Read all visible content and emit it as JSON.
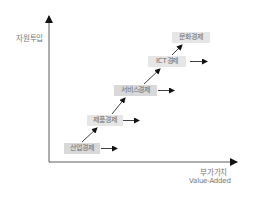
{
  "diagram": {
    "y_axis_label": "자원투입",
    "x_axis_label_ko": "부가가치",
    "x_axis_label_en": "Value-Added",
    "stages": [
      {
        "label": "산업경제"
      },
      {
        "label": "제품경제"
      },
      {
        "label": "서비스경제"
      },
      {
        "label": "ICT경제"
      },
      {
        "label": "문화경제"
      }
    ],
    "colors": {
      "axis": "#333333",
      "arrow": "#111111",
      "box_fill": "#d9d9d9",
      "text": "#777777"
    }
  }
}
